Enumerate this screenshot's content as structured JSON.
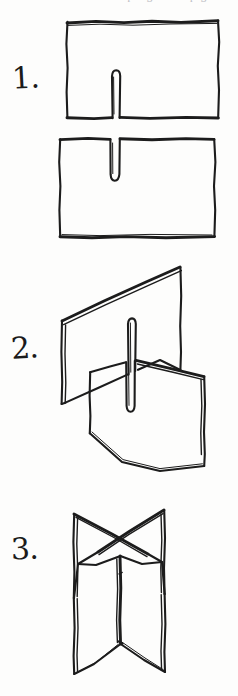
{
  "document": {
    "kind": "hand-drawn instructional diagram",
    "medium": "ink on paper, scanned",
    "subject": "Slotting two rectangular cards together to build a freestanding cross",
    "ink_color": "#1c1c1c",
    "paper_color": "#fdfdfc"
  },
  "cropped_header": {
    "note": "bottom sliver of a cut-off line of text at the very top of the scan, illegible",
    "ghost_text": "cut off line of text at the top edge of the page",
    "color": "#b9b9c0"
  },
  "steps": [
    {
      "numeral": "1.",
      "name": "cut-slots-in-two-cards",
      "caption": "Cut a narrow slot halfway into each of two rectangular cards",
      "figures": [
        {
          "name": "card-with-slot-from-bottom",
          "shape": "rectangle",
          "slot_edge": "bottom",
          "slot_depth": "about half the card height",
          "slot_position": "centered"
        },
        {
          "name": "card-with-slot-from-top",
          "shape": "rectangle",
          "slot_edge": "top",
          "slot_depth": "about half the card height",
          "slot_position": "centered"
        }
      ]
    },
    {
      "numeral": "2.",
      "name": "slide-cards-together",
      "caption": "Hold the cards upright at right angles and slide the two slots into each other",
      "figures": [
        {
          "name": "upper-card-perspective",
          "shape": "tilted rectangle in perspective",
          "slot_edge": "bottom"
        },
        {
          "name": "lower-card-perspective",
          "shape": "tilted rectangle in perspective",
          "slot_edge": "top"
        }
      ]
    },
    {
      "numeral": "3.",
      "name": "finished-cross-stand",
      "caption": "The joined cards form a four-armed cross that stands on its own",
      "figures": [
        {
          "name": "assembled-cross",
          "shape": "two interlocked panels seen from above, forming an X",
          "arms": 4
        }
      ]
    }
  ]
}
